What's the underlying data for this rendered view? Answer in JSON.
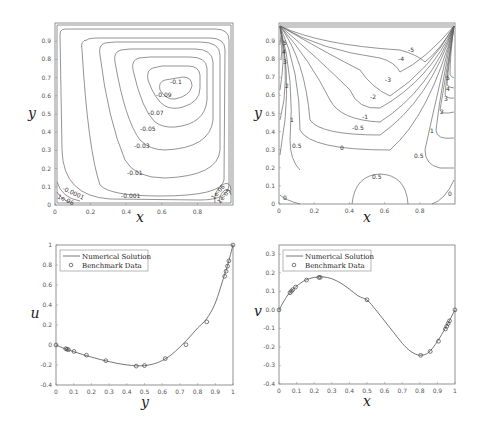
{
  "chart_data": [
    {
      "type": "contour",
      "title": "",
      "xlabel": "x",
      "ylabel": "y",
      "xlim": [
        0,
        1
      ],
      "ylim": [
        0,
        1
      ],
      "xticks": [
        "0",
        "0.2",
        "0.4",
        "0.6",
        "0.8"
      ],
      "yticks": [
        "0",
        "0.1",
        "0.2",
        "0.3",
        "0.4",
        "0.5",
        "0.6",
        "0.7",
        "0.8",
        "0.9"
      ],
      "contour_labels": [
        "-0.1",
        "-0.09",
        "-0.07",
        "-0.05",
        "-0.03",
        "-0.01",
        "-0.001",
        "-0.0001",
        "1e-06",
        "1e-06",
        "1e-05"
      ],
      "description": "Stream function contours, lid-driven cavity"
    },
    {
      "type": "contour",
      "title": "",
      "xlabel": "x",
      "ylabel": "y",
      "xlim": [
        0,
        1
      ],
      "ylim": [
        0,
        1
      ],
      "xticks": [
        "0",
        "0.2",
        "0.4",
        "0.6",
        "0.8"
      ],
      "yticks": [
        "0",
        "0.1",
        "0.2",
        "0.3",
        "0.4",
        "0.5",
        "0.6",
        "0.7",
        "0.8",
        "0.9"
      ],
      "contour_labels": [
        "5",
        "4",
        "3",
        "2",
        "1",
        "0.5",
        "0",
        "-0.5",
        "-1",
        "-2",
        "-3",
        "-4",
        "-5",
        "5",
        "4",
        "3",
        "2",
        "1",
        "0.5",
        "0",
        "0.5",
        "0"
      ],
      "description": "Vorticity contours, lid-driven cavity"
    },
    {
      "type": "line",
      "title": "",
      "xlabel": "y",
      "ylabel": "u",
      "xlim": [
        0,
        1
      ],
      "ylim": [
        -0.4,
        1
      ],
      "xticks": [
        "0",
        "0.1",
        "0.2",
        "0.3",
        "0.4",
        "0.5",
        "0.6",
        "0.7",
        "0.8",
        "0.9",
        "1"
      ],
      "yticks": [
        "-0.4",
        "-0.2",
        "0",
        "0.2",
        "0.4",
        "0.6",
        "0.8",
        "1"
      ],
      "legend": [
        "Numerical Solution",
        "Benchmark Data"
      ],
      "legend_position": "upper left",
      "series": [
        {
          "name": "Numerical Solution",
          "style": "line",
          "x": [
            0,
            0.05,
            0.1,
            0.15,
            0.2,
            0.25,
            0.3,
            0.35,
            0.4,
            0.45,
            0.5,
            0.55,
            0.6,
            0.65,
            0.7,
            0.75,
            0.8,
            0.85,
            0.9,
            0.95,
            0.97,
            1.0
          ],
          "y": [
            0,
            -0.037,
            -0.066,
            -0.095,
            -0.121,
            -0.145,
            -0.166,
            -0.185,
            -0.199,
            -0.208,
            -0.206,
            -0.19,
            -0.156,
            -0.1,
            -0.02,
            0.07,
            0.17,
            0.26,
            0.42,
            0.69,
            0.8,
            1.0
          ]
        },
        {
          "name": "Benchmark Data",
          "style": "marker-circle",
          "x": [
            0,
            0.0547,
            0.0625,
            0.0703,
            0.1016,
            0.1719,
            0.2813,
            0.4531,
            0.5,
            0.6172,
            0.7344,
            0.8516,
            0.9531,
            0.9609,
            0.9688,
            0.9766,
            1.0
          ],
          "y": [
            0,
            -0.0372,
            -0.0419,
            -0.0477,
            -0.0643,
            -0.1015,
            -0.1566,
            -0.2109,
            -0.2058,
            -0.1364,
            0.0033,
            0.2315,
            0.6872,
            0.7372,
            0.7887,
            0.8412,
            1.0
          ]
        }
      ]
    },
    {
      "type": "line",
      "title": "",
      "xlabel": "x",
      "ylabel": "v",
      "xlim": [
        0,
        1
      ],
      "ylim": [
        -0.4,
        0.35
      ],
      "xticks": [
        "0",
        "0.1",
        "0.2",
        "0.3",
        "0.4",
        "0.5",
        "0.6",
        "0.7",
        "0.8",
        "0.9",
        "1"
      ],
      "yticks": [
        "-0.4",
        "-0.3",
        "-0.2",
        "-0.1",
        "0.0",
        "0.1",
        "0.2",
        "0.3"
      ],
      "legend": [
        "Numerical Solution",
        "Benchmark Data"
      ],
      "legend_position": "upper left",
      "series": [
        {
          "name": "Numerical Solution",
          "style": "line",
          "x": [
            0,
            0.05,
            0.1,
            0.15,
            0.2,
            0.25,
            0.3,
            0.35,
            0.4,
            0.45,
            0.5,
            0.55,
            0.6,
            0.65,
            0.7,
            0.75,
            0.8,
            0.85,
            0.9,
            0.95,
            1.0
          ],
          "y": [
            0,
            0.08,
            0.128,
            0.16,
            0.175,
            0.178,
            0.168,
            0.145,
            0.112,
            0.075,
            0.053,
            0.0,
            -0.06,
            -0.12,
            -0.18,
            -0.225,
            -0.245,
            -0.23,
            -0.17,
            -0.09,
            0
          ]
        },
        {
          "name": "Benchmark Data",
          "style": "marker-circle",
          "x": [
            0,
            0.0625,
            0.0703,
            0.0781,
            0.0938,
            0.1563,
            0.2266,
            0.2344,
            0.5,
            0.8047,
            0.8594,
            0.9063,
            0.9453,
            0.9531,
            0.9609,
            0.9688,
            1.0
          ],
          "y": [
            0,
            0.0923,
            0.1009,
            0.1089,
            0.1232,
            0.1608,
            0.1751,
            0.1753,
            0.0545,
            -0.2453,
            -0.2245,
            -0.1691,
            -0.1031,
            -0.0886,
            -0.0739,
            -0.0591,
            0
          ]
        }
      ]
    }
  ]
}
